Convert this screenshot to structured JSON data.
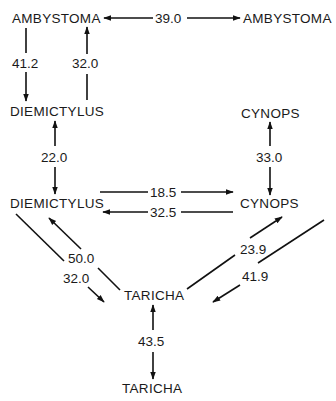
{
  "diagram": {
    "type": "phylogenetic-distance-graph",
    "nodes": [
      {
        "id": "ambystoma_a",
        "label": "AMBYSTOMA"
      },
      {
        "id": "ambystoma_b",
        "label": "AMBYSTOMA"
      },
      {
        "id": "diemictylus_a",
        "label": "DIEMICTYLUS"
      },
      {
        "id": "cynops_a",
        "label": "CYNOPS"
      },
      {
        "id": "diemictylus_b",
        "label": "DIEMICTYLUS"
      },
      {
        "id": "cynops_b",
        "label": "CYNOPS"
      },
      {
        "id": "taricha_a",
        "label": "TARICHA"
      },
      {
        "id": "taricha_b",
        "label": "TARICHA"
      }
    ],
    "edges": [
      {
        "from": "ambystoma_a",
        "to": "ambystoma_b",
        "label": "39.0",
        "direction": "bidirectional"
      },
      {
        "from": "ambystoma_a",
        "to": "diemictylus_a",
        "label": "41.2",
        "direction": "forward"
      },
      {
        "from": "diemictylus_a",
        "to": "ambystoma_a",
        "label": "32.0",
        "direction": "forward"
      },
      {
        "from": "diemictylus_a",
        "to": "diemictylus_b",
        "label": "22.0",
        "direction": "bidirectional"
      },
      {
        "from": "cynops_a",
        "to": "cynops_b",
        "label": "33.0",
        "direction": "bidirectional"
      },
      {
        "from": "diemictylus_b",
        "to": "cynops_b",
        "label": "18.5",
        "direction": "forward"
      },
      {
        "from": "cynops_b",
        "to": "diemictylus_b",
        "label": "32.5",
        "direction": "forward"
      },
      {
        "from": "taricha_a",
        "to": "diemictylus_b",
        "label": "50.0",
        "direction": "forward"
      },
      {
        "from": "diemictylus_b",
        "to": "taricha_a",
        "label": "32.0",
        "direction": "forward"
      },
      {
        "from": "taricha_a",
        "to": "cynops_b",
        "label": "23.9",
        "direction": "forward"
      },
      {
        "from": "cynops_b",
        "to": "taricha_a",
        "label": "41.9",
        "direction": "forward"
      },
      {
        "from": "taricha_a",
        "to": "taricha_b",
        "label": "43.5",
        "direction": "bidirectional"
      }
    ]
  },
  "colors": {
    "line": "#111111",
    "text": "#1a1a1a",
    "background": "#ffffff"
  }
}
